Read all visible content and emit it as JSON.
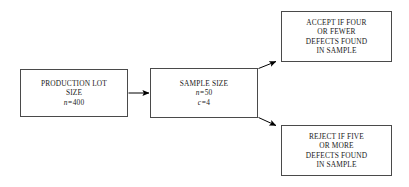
{
  "diagram": {
    "type": "flowchart",
    "background_color": "#ffffff",
    "line_color": "#4a4a4a",
    "text_color": "#1a1a1a",
    "arrow_color": "#000000",
    "nodes": [
      {
        "id": "production",
        "role": "input-lot",
        "lines": [
          "PRODUCTION LOT",
          "SIZE"
        ],
        "variables": [
          {
            "symbol": "n",
            "operator": "=",
            "value": "400"
          }
        ]
      },
      {
        "id": "sample",
        "role": "sampling-plan",
        "lines": [
          "SAMPLE SIZE"
        ],
        "variables": [
          {
            "symbol": "n",
            "operator": "=",
            "value": "50"
          },
          {
            "symbol": "c",
            "operator": "=",
            "value": "4"
          }
        ]
      },
      {
        "id": "accept",
        "role": "accept-outcome",
        "lines": [
          "ACCEPT IF FOUR",
          "OR FEWER",
          "DEFECTS FOUND",
          "IN SAMPLE"
        ],
        "variables": []
      },
      {
        "id": "reject",
        "role": "reject-outcome",
        "lines": [
          "REJECT IF FIVE",
          "OR MORE",
          "DEFECTS FOUND",
          "IN SAMPLE"
        ],
        "variables": []
      }
    ],
    "edges": [
      {
        "id": "production-to-sample",
        "from": "production",
        "to": "sample",
        "style": "straight-horizontal"
      },
      {
        "id": "sample-to-accept",
        "from": "sample",
        "to": "accept",
        "style": "diagonal-up"
      },
      {
        "id": "sample-to-reject",
        "from": "sample",
        "to": "reject",
        "style": "diagonal-down"
      }
    ]
  }
}
